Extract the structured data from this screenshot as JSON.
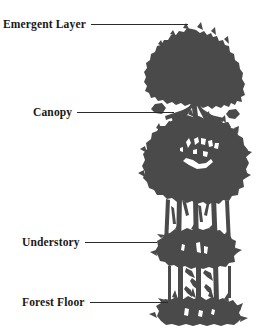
{
  "figure": {
    "background_color": "#ffffff",
    "silhouette_color": "#4a4a4a",
    "line_color": "#2b2b2b",
    "text_color": "#181818",
    "width": 262,
    "height": 332
  },
  "labels": [
    {
      "id": "emergent-layer",
      "text": "Emergent Layer",
      "leader_line_width": 97,
      "leader_line_from_x": 93,
      "leader_line_to_x": 190,
      "y": 24
    },
    {
      "id": "canopy",
      "text": "Canopy",
      "leader_line_width": 97,
      "leader_line_from_x": 78,
      "leader_line_to_x": 175,
      "y": 112
    },
    {
      "id": "understory",
      "text": "Understory",
      "leader_line_width": 72,
      "leader_line_from_x": 88,
      "leader_line_to_x": 160,
      "y": 242
    },
    {
      "id": "forest-floor",
      "text": "Forest Floor",
      "leader_line_width": 78,
      "leader_line_from_x": 90,
      "leader_line_to_x": 168,
      "y": 302
    }
  ]
}
